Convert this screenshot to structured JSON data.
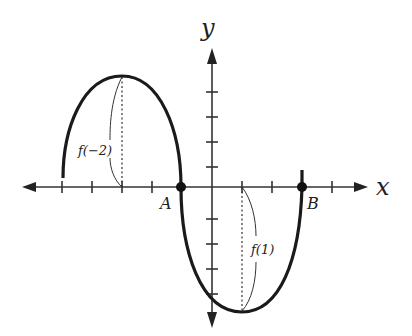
{
  "diagram": {
    "title": "",
    "axes": {
      "x_label": "x",
      "y_label": "y",
      "origin_px": [
        212,
        187
      ],
      "unit_px": 30,
      "x_ticks": [
        -5,
        -4,
        -3,
        -2,
        1,
        2,
        4
      ],
      "y_ticks": [
        1,
        2,
        3,
        4,
        -1,
        -2,
        -3,
        -4
      ]
    },
    "points": [
      {
        "name": "A",
        "label": "A",
        "x": -1,
        "y": 0
      },
      {
        "name": "B",
        "label": "B",
        "x": 3,
        "y": 0
      }
    ],
    "annotations": [
      {
        "name": "f-neg2",
        "label": "f(−2)",
        "at_x": -3,
        "note": "vertical distance from x-axis to local maximum"
      },
      {
        "name": "f-1",
        "label": "f(1)",
        "at_x": 1,
        "note": "vertical distance from x-axis to local minimum"
      }
    ],
    "curve": {
      "description": "Sinusoid-like curve: rises from x=-5 to local max near x=-3, crosses x-axis at A (x=-1), falls to local min near x=1, rises through B (x=3)",
      "color": "#1a1a1a"
    },
    "colors": {
      "axis": "#333333",
      "curve": "#1a1a1a",
      "background": "#ffffff"
    }
  }
}
